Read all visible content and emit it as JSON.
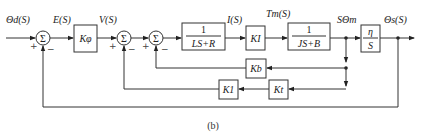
{
  "diagram": {
    "type": "control-system-block-diagram",
    "caption": "(b)",
    "signals": {
      "input": "Θd(S)",
      "error": "E(S)",
      "voltage": "V(S)",
      "current": "I(S)",
      "torque": "Tm(S)",
      "speed": "SΘm",
      "output": "Θs(S)"
    },
    "blocks": {
      "k_phi": "Kφ",
      "electrical_num": "1",
      "electrical_den": "LS+R",
      "k_i": "KI",
      "mechanical_num": "1",
      "mechanical_den": "JS+B",
      "gear_num": "η",
      "gear_den": "S",
      "k_b": "Kb",
      "k_t": "Kt",
      "k_1": "K1"
    },
    "summing_junctions": [
      {
        "id": "sum1",
        "symbol": "Σ",
        "signs": [
          "+",
          "−"
        ]
      },
      {
        "id": "sum2",
        "symbol": "Σ",
        "signs": [
          "+",
          "−"
        ]
      },
      {
        "id": "sum3",
        "symbol": "Σ",
        "signs": [
          "+",
          "−"
        ]
      }
    ],
    "feedback_paths": [
      "SΘm → Kb → sum3 (−)",
      "SΘm → Kt → K1 → sum2 (−)",
      "Θs(S) → sum1 (−)"
    ]
  }
}
